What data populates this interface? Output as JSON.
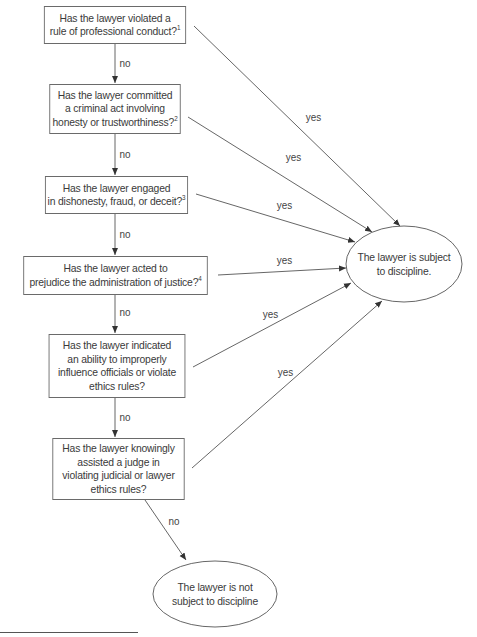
{
  "diagram": {
    "type": "flowchart",
    "title_cutoff": "",
    "decisions": [
      {
        "id": "q1",
        "lines": [
          "Has the lawyer violated a",
          "rule of professional conduct?"
        ],
        "footnote": "1"
      },
      {
        "id": "q2",
        "lines": [
          "Has the lawyer committed",
          "a criminal act involving",
          "honesty or trustworthiness?"
        ],
        "footnote": "2"
      },
      {
        "id": "q3",
        "lines": [
          "Has the lawyer engaged",
          "in dishonesty, fraud, or deceit?"
        ],
        "footnote": "3"
      },
      {
        "id": "q4",
        "lines": [
          "Has the lawyer acted to",
          "prejudice the administration of justice?"
        ],
        "footnote": "4"
      },
      {
        "id": "q5",
        "lines": [
          "Has the lawyer indicated",
          "an ability to improperly",
          "influence officials or violate",
          "ethics rules?"
        ],
        "footnote": ""
      },
      {
        "id": "q6",
        "lines": [
          "Has the lawyer knowingly",
          "assisted a judge in",
          "violating judicial or lawyer",
          "ethics rules?"
        ],
        "footnote": ""
      }
    ],
    "outcomes": {
      "subject": {
        "lines": [
          "The lawyer is subject",
          "to discipline."
        ]
      },
      "not_subject": {
        "lines": [
          "The lawyer is not",
          "subject to discipline"
        ]
      }
    },
    "edge_labels": {
      "no": "no",
      "yes": "yes"
    },
    "edges": [
      {
        "from": "q1",
        "to": "q2",
        "label": "no"
      },
      {
        "from": "q2",
        "to": "q3",
        "label": "no"
      },
      {
        "from": "q3",
        "to": "q4",
        "label": "no"
      },
      {
        "from": "q4",
        "to": "q5",
        "label": "no"
      },
      {
        "from": "q5",
        "to": "q6",
        "label": "no"
      },
      {
        "from": "q6",
        "to": "not_subject",
        "label": "no"
      },
      {
        "from": "q1",
        "to": "subject",
        "label": "yes"
      },
      {
        "from": "q2",
        "to": "subject",
        "label": "yes"
      },
      {
        "from": "q3",
        "to": "subject",
        "label": "yes"
      },
      {
        "from": "q4",
        "to": "subject",
        "label": "yes"
      },
      {
        "from": "q5",
        "to": "subject",
        "label": "yes"
      },
      {
        "from": "q6",
        "to": "subject",
        "label": "yes"
      }
    ]
  },
  "colors": {
    "line": "#555555",
    "text": "#3a3a3a",
    "background": "#ffffff"
  }
}
